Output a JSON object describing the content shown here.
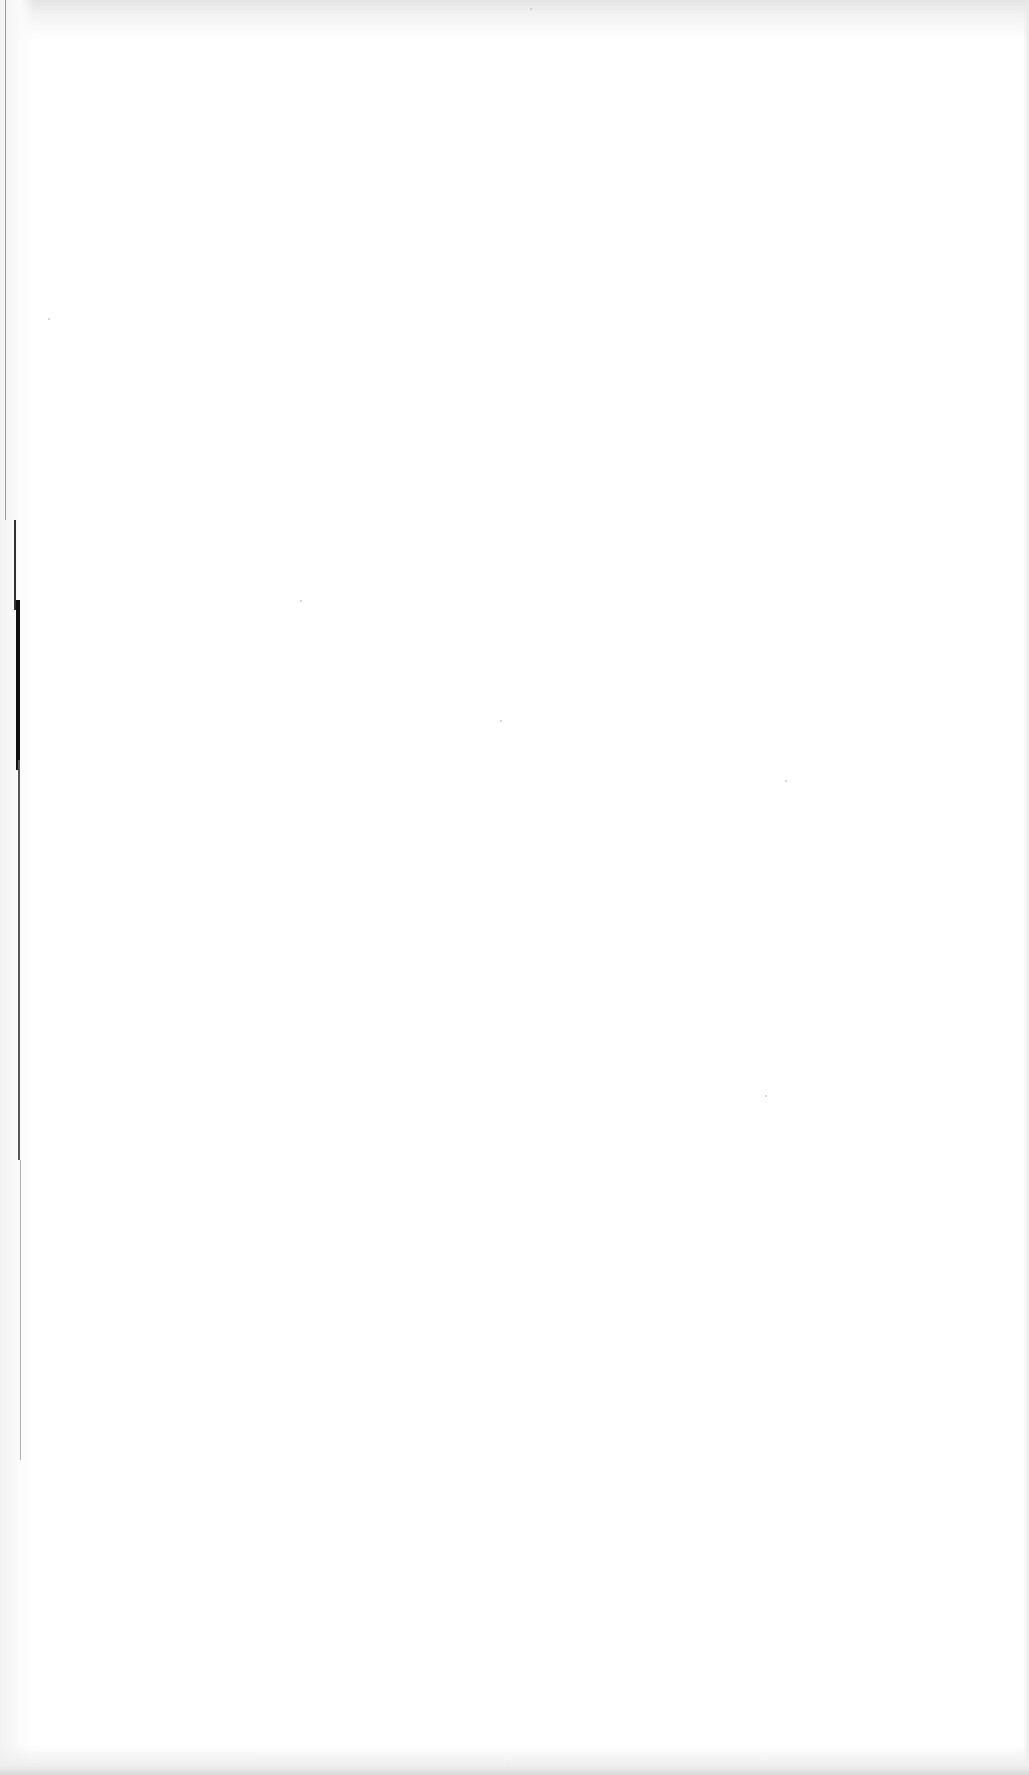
{
  "document": {
    "type": "scanned-page",
    "content": "",
    "background_color": "#ffffff",
    "edge_color": "#111111",
    "shade_color": "#e4e4e4"
  }
}
